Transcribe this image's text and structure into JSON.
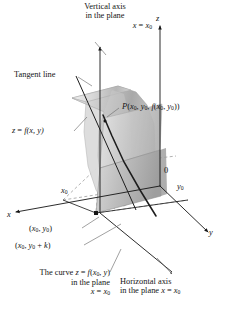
{
  "figure": {
    "kind": "3d-calculus-diagram",
    "topic": "partial derivative with respect to y: slice of surface z = f(x,y) by the plane x = x0",
    "background": "#ffffff",
    "ink": "#141414",
    "surface_light": "#e4e4e4",
    "surface_mid": "#c3c3c3",
    "surface_dark": "#9b9b9b",
    "plane_fill": "#b9b9b9",
    "dash_color": "#8c8c8c"
  },
  "axes": {
    "z_label": "z",
    "x_label": "x",
    "y_label": "y",
    "origin_label": "0",
    "x0_tick_label": "x",
    "x0_tick_sub": "0",
    "y0_tick_label": "y",
    "y0_tick_sub": "0"
  },
  "callouts": {
    "vertical_axis": {
      "line1": "Vertical axis",
      "line2": "in the plane",
      "line3_var": "x",
      "line3_eq": " = ",
      "line3_val": "x",
      "line3_sub": "0"
    },
    "tangent_line": {
      "text": "Tangent line"
    },
    "surface": {
      "z": "z",
      "eq": " = ",
      "f": "f",
      "args": "(x, y)"
    },
    "point_P": {
      "p": "P",
      "open": "(",
      "x0": "x",
      "x0sub": "0",
      "c1": ", ",
      "y0": "y",
      "y0sub": "0",
      "c2": ", ",
      "f": "f",
      "fopen": "(",
      "fx0": "x",
      "fx0sub": "0",
      "c3": ", ",
      "fy0": "y",
      "fy0sub": "0",
      "fclose": ")",
      "close": ")"
    },
    "point_xy": {
      "open": "(",
      "x0": "x",
      "x0sub": "0",
      "comma": ", ",
      "y0": "y",
      "y0sub": "0",
      "close": ")"
    },
    "point_xyk": {
      "open": "(",
      "x0": "x",
      "x0sub": "0",
      "comma": ", ",
      "y0": "y",
      "y0sub": "0",
      "plus": " + ",
      "k": "k",
      "close": ")"
    },
    "curve": {
      "line1_a": "The curve ",
      "line1_z": "z",
      "line1_eq": " = ",
      "line1_f": "f",
      "line1_open": "(",
      "line1_x0": "x",
      "line1_x0sub": "0",
      "line1_comma": ", ",
      "line1_y": "y",
      "line1_close": ")",
      "line2": "in the plane",
      "line3_var": "x",
      "line3_eq": " = ",
      "line3_val": "x",
      "line3_sub": "0"
    },
    "horizontal_axis": {
      "line1": "Horizontal axis",
      "line2_a": "in the plane ",
      "line2_x": "x",
      "line2_eq": " = ",
      "line2_x0": "x",
      "line2_x0sub": "0"
    }
  }
}
